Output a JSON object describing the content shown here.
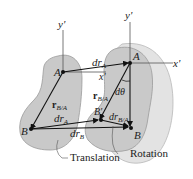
{
  "diagram": {
    "type": "rigid-body-motion",
    "colors": {
      "body_fill": "#c9c9c9",
      "body_stroke": "#9a9a9a",
      "rotated_body_fill": "#e3e3e3",
      "line": "#111111",
      "text": "#222222"
    },
    "left_frame": {
      "y_axis_label": "y'",
      "point_A": "A",
      "point_B": "B",
      "vector_rBA": "r",
      "vector_rBA_sub": "B/A"
    },
    "right_frame": {
      "y_axis_label": "y'",
      "x_axis_label": "x'",
      "x_axis_label_mid": "x'",
      "point_A": "A",
      "point_B": "B",
      "point_B_prime": "B'",
      "vector_rBA": "r",
      "vector_rBA_sub": "B/A",
      "angle_label": "dθ"
    },
    "vectors": {
      "drA_top": "dr",
      "drA_top_sub": "A",
      "drA_bottom": "dr",
      "drA_bottom_sub": "A",
      "drB": "dr",
      "drB_sub": "B",
      "drBA": "dr",
      "drBA_sub": "B/A"
    },
    "captions": {
      "translation": "Translation",
      "rotation": "Rotation"
    }
  }
}
